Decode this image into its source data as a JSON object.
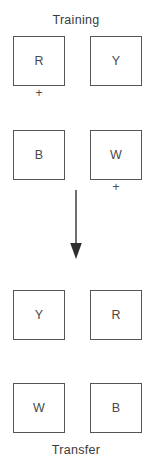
{
  "figure": {
    "width": 152,
    "height": 464,
    "background_color": "#ffffff",
    "line_color": "#555555",
    "text_color": "#4a4a4a"
  },
  "training": {
    "caption": "Training",
    "rows": [
      {
        "left": {
          "letter": "R",
          "reinforced": true,
          "plus": "+"
        },
        "right": {
          "letter": "Y",
          "reinforced": false,
          "plus": ""
        }
      },
      {
        "left": {
          "letter": "B",
          "reinforced": false,
          "plus": ""
        },
        "right": {
          "letter": "W",
          "reinforced": true,
          "plus": "+"
        }
      }
    ]
  },
  "arrow": {
    "name": "down-arrow",
    "direction": "down"
  },
  "transfer": {
    "caption": "Transfer",
    "rows": [
      {
        "left": {
          "letter": "Y"
        },
        "right": {
          "letter": "R"
        }
      },
      {
        "left": {
          "letter": "W"
        },
        "right": {
          "letter": "B"
        }
      }
    ]
  }
}
